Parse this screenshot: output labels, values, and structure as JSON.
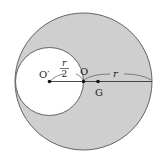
{
  "diagram": {
    "type": "geometry",
    "colors": {
      "shade": "#cfcfcf",
      "stroke": "#555555",
      "hole": "#ffffff",
      "text": "#222222"
    },
    "large_circle": {
      "center_label": "O",
      "cx": 83.5,
      "cy": 81.5,
      "r": 68.5
    },
    "small_circle": {
      "center_label": "O′",
      "cx": 49.5,
      "cy": 81.5,
      "r": 34
    },
    "points": [
      {
        "label": "O′",
        "x": 49.5,
        "y": 81.5
      },
      {
        "label": "O",
        "x": 83.5,
        "y": 81.5
      },
      {
        "label": "G",
        "x": 98,
        "y": 81.5
      }
    ],
    "labels": {
      "o_prime": "O′",
      "o": "O",
      "g": "G",
      "half_r_num": "r",
      "half_r_den": "2",
      "r": "r"
    }
  }
}
